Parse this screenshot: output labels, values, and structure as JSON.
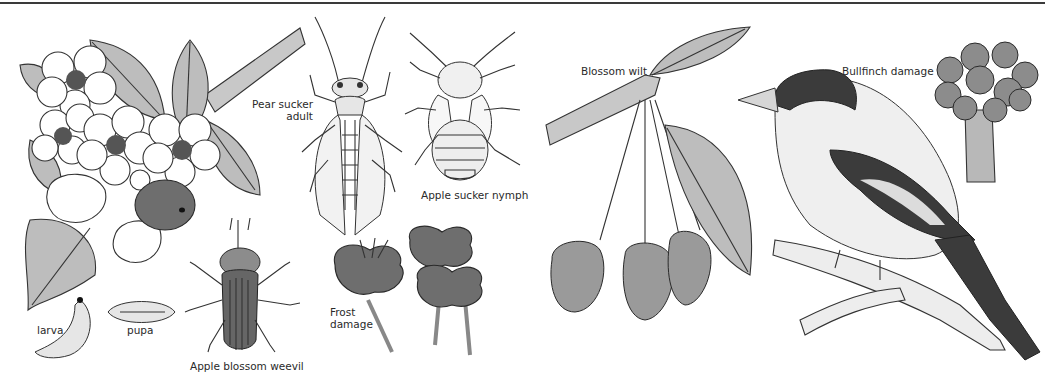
{
  "plate": {
    "type": "botanical pest and disease illustration plate",
    "labels": {
      "larva": "larva",
      "pupa": "pupa",
      "weevil": "Apple blossom weevil",
      "pear_sucker_line1": "Pear sucker",
      "pear_sucker_line2": "adult",
      "apple_sucker": "Apple sucker nymph",
      "frost_line1": "Frost",
      "frost_line2": "damage",
      "blossom_wilt": "Blossom wilt",
      "bullfinch": "Bullfinch damage"
    },
    "colors": {
      "ink": "#333333",
      "leaf_shade": "#bdbdbd",
      "rule": "#3a3a3a",
      "background": "#ffffff"
    }
  }
}
